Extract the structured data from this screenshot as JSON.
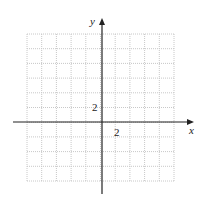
{
  "diagram": {
    "type": "coordinate-grid",
    "grid": {
      "left": 27,
      "top": 34,
      "cols": 10,
      "rows": 10,
      "cell": 14.7,
      "line_color": "#c8c8c8",
      "style": "dotted"
    },
    "axes": {
      "origin_px": {
        "x": 102,
        "y": 122
      },
      "x_axis": {
        "label": "x",
        "from_px": 13,
        "to_px": 194
      },
      "y_axis": {
        "label": "y",
        "from_px": 194,
        "to_px": 18
      },
      "color": "#222222"
    },
    "tick_labels": {
      "x": "2",
      "y": "2"
    },
    "scale": "each grid square = 1 unit; labeled tick 2"
  }
}
